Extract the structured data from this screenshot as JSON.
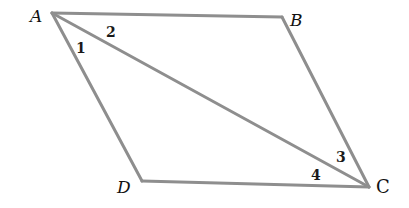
{
  "diagram": {
    "type": "parallelogram",
    "colors": {
      "line": "#8e8e8e",
      "text": "#111111",
      "background": "#ffffff"
    },
    "vertices": [
      {
        "name": "A",
        "x": 52,
        "y": 13
      },
      {
        "name": "B",
        "x": 282,
        "y": 17
      },
      {
        "name": "C",
        "x": 369,
        "y": 187
      },
      {
        "name": "D",
        "x": 142,
        "y": 181
      }
    ],
    "edges": [
      [
        "A",
        "B"
      ],
      [
        "B",
        "C"
      ],
      [
        "C",
        "D"
      ],
      [
        "D",
        "A"
      ],
      [
        "A",
        "C"
      ]
    ],
    "diagonal": [
      "A",
      "C"
    ],
    "vertex_labels": {
      "A": "A",
      "B": "B",
      "C": "C",
      "D": "D"
    },
    "angle_labels": {
      "angle1": "1",
      "angle2": "2",
      "angle3": "3",
      "angle4": "4"
    }
  }
}
